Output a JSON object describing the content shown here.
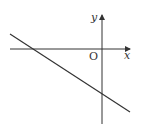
{
  "diagram": {
    "type": "coordinate-plane-line",
    "axes": {
      "x_label": "x",
      "y_label": "y",
      "origin_label": "O"
    },
    "line": {
      "description": "straight line with negative slope, crossing negative x-axis and negative y-axis",
      "slope_sign": "negative",
      "x_intercept_sign": "negative",
      "y_intercept_sign": "negative"
    },
    "colors": {
      "stroke": "#333333",
      "background": "#ffffff"
    }
  }
}
